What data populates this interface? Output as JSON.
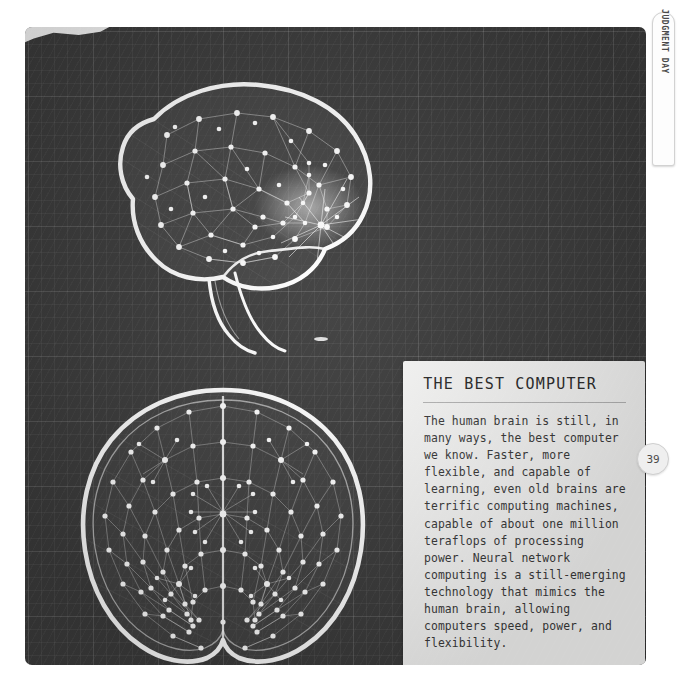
{
  "page": {
    "number": "39",
    "side_tab_label": "JUDGMENT DAY"
  },
  "card": {
    "heading": "THE BEST COMPUTER",
    "body": "The human brain is still, in many ways, the best computer we know. Faster, more flexible, and capable of learning, even old brains are terrific computing machines, capable of about one million teraflops of processing power. Neural network computing is a still-emerging technology that mimics the human brain, allowing computers speed, power, and flexibility."
  },
  "illustration": {
    "top_brain_name": "brain-side-view-neural-network",
    "bottom_brain_name": "brain-top-view-neural-network",
    "background_name": "dark-grid-paper"
  },
  "colors": {
    "panel_bg": "#3c3c3c",
    "grid_line": "#525252",
    "card_bg": "#fbfbfa",
    "ink": "#3a3a3a",
    "illustration": "#ffffff"
  }
}
